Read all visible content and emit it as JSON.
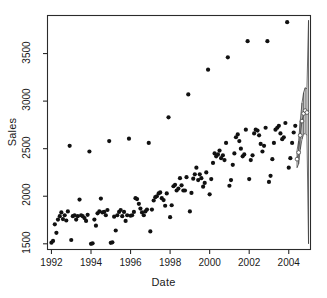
{
  "chart_data": {
    "type": "scatter",
    "title": "",
    "xlabel": "Date",
    "ylabel": "Sales",
    "grid": false,
    "legend": "none",
    "xlim": [
      1991.8,
      2005.1
    ],
    "ylim": [
      1440,
      3900
    ],
    "xticks": [
      1992,
      1994,
      1996,
      1998,
      2000,
      2002,
      2004
    ],
    "yticks": [
      1500,
      2000,
      2500,
      3000,
      3500
    ],
    "xtick_labels": [
      "1992",
      "1994",
      "1996",
      "1998",
      "2000",
      "2002",
      "2004"
    ],
    "ytick_labels": [
      "1500",
      "2000",
      "2500",
      "3000",
      "3500"
    ],
    "point_style": "filled-circle",
    "series": [
      {
        "name": "Sales",
        "x": [
          1992.0,
          1992.08,
          1992.17,
          1992.25,
          1992.33,
          1992.42,
          1992.5,
          1992.58,
          1992.67,
          1992.75,
          1992.83,
          1992.92,
          1993.0,
          1993.08,
          1993.17,
          1993.25,
          1993.33,
          1993.42,
          1993.5,
          1993.58,
          1993.67,
          1993.75,
          1993.83,
          1993.92,
          1994.0,
          1994.08,
          1994.17,
          1994.25,
          1994.33,
          1994.42,
          1994.5,
          1994.58,
          1994.67,
          1994.75,
          1994.83,
          1994.92,
          1995.0,
          1995.08,
          1995.17,
          1995.25,
          1995.33,
          1995.42,
          1995.5,
          1995.58,
          1995.67,
          1995.75,
          1995.83,
          1995.92,
          1996.0,
          1996.08,
          1996.17,
          1996.25,
          1996.33,
          1996.42,
          1996.5,
          1996.58,
          1996.67,
          1996.75,
          1996.83,
          1996.92,
          1997.0,
          1997.08,
          1997.17,
          1997.25,
          1997.33,
          1997.42,
          1997.5,
          1997.58,
          1997.67,
          1997.75,
          1997.83,
          1997.92,
          1998.0,
          1998.08,
          1998.17,
          1998.25,
          1998.33,
          1998.42,
          1998.5,
          1998.58,
          1998.67,
          1998.75,
          1998.83,
          1998.92,
          1999.0,
          1999.08,
          1999.17,
          1999.25,
          1999.33,
          1999.42,
          1999.5,
          1999.58,
          1999.67,
          1999.75,
          1999.83,
          1999.92,
          2000.0,
          2000.08,
          2000.17,
          2000.25,
          2000.33,
          2000.42,
          2000.5,
          2000.58,
          2000.67,
          2000.75,
          2000.83,
          2000.92,
          2001.0,
          2001.08,
          2001.17,
          2001.25,
          2001.33,
          2001.42,
          2001.5,
          2001.58,
          2001.67,
          2001.75,
          2001.83,
          2001.92,
          2002.0,
          2002.08,
          2002.17,
          2002.25,
          2002.33,
          2002.42,
          2002.5,
          2002.58,
          2002.67,
          2002.75,
          2002.83,
          2002.92,
          2003.0,
          2003.08,
          2003.17,
          2003.25,
          2003.33,
          2003.42,
          2003.5,
          2003.58,
          2003.67,
          2003.75,
          2003.83,
          2003.92,
          2004.0,
          2004.08,
          2004.17,
          2004.25,
          2004.33
        ],
        "y": [
          1512,
          1530,
          1705,
          1615,
          1755,
          1790,
          1830,
          1760,
          1800,
          1745,
          1840,
          2530,
          1540,
          1790,
          1800,
          1755,
          1790,
          1965,
          1800,
          1790,
          1770,
          1740,
          1805,
          2470,
          1500,
          1505,
          1755,
          1690,
          1820,
          1840,
          1975,
          1830,
          1835,
          1800,
          1855,
          2580,
          1510,
          1515,
          1785,
          1640,
          1800,
          1835,
          1855,
          1790,
          1835,
          1740,
          1800,
          2605,
          1795,
          1800,
          1835,
          1980,
          1970,
          1920,
          1870,
          1830,
          1800,
          1840,
          1860,
          2560,
          1630,
          1860,
          1955,
          1990,
          2000,
          2030,
          2040,
          1980,
          1960,
          1900,
          2030,
          2830,
          1780,
          1905,
          2105,
          2120,
          2060,
          2080,
          2190,
          2115,
          2060,
          2060,
          2200,
          3070,
          1840,
          2035,
          2185,
          2230,
          2300,
          2170,
          2230,
          2190,
          2100,
          2140,
          2250,
          3330,
          2020,
          2180,
          2350,
          2450,
          2420,
          2440,
          2480,
          2400,
          2430,
          2380,
          2560,
          3460,
          2110,
          2170,
          2330,
          2450,
          2620,
          2650,
          2580,
          2500,
          2420,
          2440,
          2700,
          3630,
          2180,
          2380,
          2430,
          2660,
          2700,
          2690,
          2640,
          2550,
          2470,
          2530,
          2720,
          3630,
          2150,
          2215,
          2390,
          2560,
          2700,
          2720,
          2740,
          2660,
          2600,
          2620,
          2770,
          3830,
          2300,
          2400,
          2560,
          2670,
          2740
        ]
      }
    ],
    "forecast": {
      "style": "open-circle-with-interval-lines",
      "x": [
        2004.42,
        2004.5,
        2004.58,
        2004.67,
        2004.75,
        2004.83,
        2004.92,
        2005.0
      ],
      "y": [
        2390,
        2460,
        2640,
        2790,
        2870,
        2900,
        2880,
        2900
      ],
      "lower": [
        2300,
        2340,
        2490,
        2600,
        2650,
        2660,
        2640,
        1500
      ],
      "upper": [
        2480,
        2580,
        2790,
        2980,
        3090,
        3140,
        3130,
        3850
      ]
    }
  }
}
